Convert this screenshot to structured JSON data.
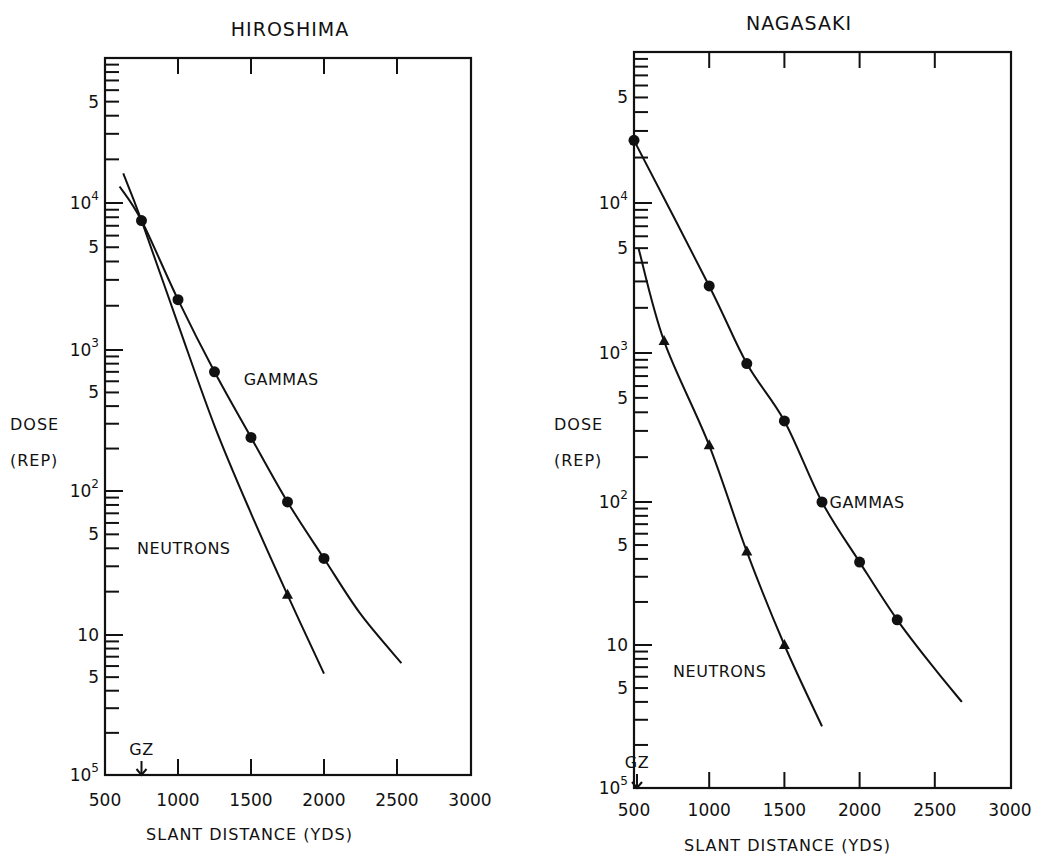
{
  "figure": {
    "charts_count": 2
  },
  "chart_data": [
    {
      "id": "hiroshima",
      "type": "line",
      "title": "HIROSHIMA",
      "xlabel": "SLANT DISTANCE (YDS)",
      "ylabel": [
        "DOSE",
        "(REP)"
      ],
      "yscale": "log",
      "xlim": [
        500,
        3000
      ],
      "ylim": [
        1,
        100000
      ],
      "x_ticks": [
        500,
        1000,
        1500,
        2000,
        2500,
        3000
      ],
      "x_tick_labels": [
        "500",
        "1000",
        "1500",
        "2000",
        "2500",
        "3000"
      ],
      "y_major_tick_labels": [
        {
          "value": 100000,
          "base": "10",
          "exp": "5"
        },
        {
          "value": 50000,
          "base": "5",
          "exp": ""
        },
        {
          "value": 10000,
          "base": "10",
          "exp": "4"
        },
        {
          "value": 5000,
          "base": "5",
          "exp": ""
        },
        {
          "value": 1000,
          "base": "10",
          "exp": "3"
        },
        {
          "value": 500,
          "base": "5",
          "exp": ""
        },
        {
          "value": 100,
          "base": "10",
          "exp": "2"
        },
        {
          "value": 50,
          "base": "5",
          "exp": ""
        },
        {
          "value": 10,
          "base": "10",
          "exp": ""
        },
        {
          "value": 5,
          "base": "5",
          "exp": ""
        }
      ],
      "grid": false,
      "annotations": [
        {
          "text": "GZ",
          "x": 750,
          "marker": "down-arrow"
        }
      ],
      "series": [
        {
          "name": "GAMMAS",
          "marker": "circle",
          "points": [
            {
              "x": 750,
              "y": 7600
            },
            {
              "x": 1000,
              "y": 2200
            },
            {
              "x": 1250,
              "y": 700
            },
            {
              "x": 1500,
              "y": 240
            },
            {
              "x": 1750,
              "y": 84
            },
            {
              "x": 2000,
              "y": 34
            }
          ],
          "curve": [
            [
              600,
              13000
            ],
            [
              750,
              7600
            ],
            [
              1000,
              2200
            ],
            [
              1250,
              700
            ],
            [
              1500,
              240
            ],
            [
              1750,
              84
            ],
            [
              2000,
              34
            ],
            [
              2250,
              14
            ],
            [
              2530,
              6.3
            ]
          ],
          "label_pos": {
            "x": 1450,
            "y": 620
          }
        },
        {
          "name": "NEUTRONS",
          "marker": "triangle",
          "points": [
            {
              "x": 1750,
              "y": 19
            }
          ],
          "curve": [
            [
              625,
              16000
            ],
            [
              750,
              7600
            ],
            [
              1000,
              1500
            ],
            [
              1250,
              290
            ],
            [
              1500,
              70
            ],
            [
              1750,
              19
            ],
            [
              2000,
              5.3
            ]
          ],
          "label_pos": {
            "x": 720,
            "y": 40
          }
        }
      ],
      "layout": {
        "plot_left": 105,
        "plot_right": 471,
        "plot_top": 58,
        "plot_bottom": 775,
        "x_px": [
          [
            500,
            105
          ],
          [
            3000,
            470
          ]
        ],
        "decade_px": {
          "100000": 58,
          "10000": 203,
          "1000": 350,
          "100": 491,
          "10": 635,
          "1": 775
        },
        "title_x": 290,
        "title_y": 36,
        "ylabel_x": 10,
        "ylabel_y1": 430,
        "ylabel_y2": 466,
        "xlabel_x": 146,
        "xlabel_y": 840,
        "xtick_label_y": 806
      }
    },
    {
      "id": "nagasaki",
      "type": "line",
      "title": "NAGASAKI",
      "xlabel": "SLANT DISTANCE (YDS)",
      "ylabel": [
        "DOSE",
        "(REP)"
      ],
      "yscale": "log",
      "xlim": [
        500,
        3000
      ],
      "ylim": [
        1,
        100000
      ],
      "x_ticks": [
        500,
        1000,
        1500,
        2000,
        2500,
        3000
      ],
      "x_tick_labels": [
        "500",
        "1000",
        "1500",
        "2000",
        "2500",
        "3000"
      ],
      "y_major_tick_labels": [
        {
          "value": 100000,
          "base": "10",
          "exp": "5"
        },
        {
          "value": 50000,
          "base": "5",
          "exp": ""
        },
        {
          "value": 10000,
          "base": "10",
          "exp": "4"
        },
        {
          "value": 5000,
          "base": "5",
          "exp": ""
        },
        {
          "value": 1000,
          "base": "10",
          "exp": "3"
        },
        {
          "value": 500,
          "base": "5",
          "exp": ""
        },
        {
          "value": 100,
          "base": "10",
          "exp": "2"
        },
        {
          "value": 50,
          "base": "5",
          "exp": ""
        },
        {
          "value": 10,
          "base": "10",
          "exp": ""
        },
        {
          "value": 5,
          "base": "5",
          "exp": ""
        }
      ],
      "grid": false,
      "annotations": [
        {
          "text": "GZ",
          "x": 520,
          "marker": "down-arrow"
        }
      ],
      "series": [
        {
          "name": "GAMMAS",
          "marker": "circle",
          "points": [
            {
              "x": 500,
              "y": 26000
            },
            {
              "x": 1000,
              "y": 2800
            },
            {
              "x": 1250,
              "y": 850
            },
            {
              "x": 1500,
              "y": 350
            },
            {
              "x": 1750,
              "y": 100
            },
            {
              "x": 2000,
              "y": 38
            },
            {
              "x": 2250,
              "y": 15
            }
          ],
          "curve": [
            [
              500,
              26000
            ],
            [
              1000,
              2800
            ],
            [
              1250,
              850
            ],
            [
              1500,
              350
            ],
            [
              1750,
              100
            ],
            [
              2000,
              38
            ],
            [
              2250,
              15
            ],
            [
              2500,
              6.8
            ],
            [
              2680,
              4
            ]
          ],
          "label_pos": {
            "x": 1800,
            "y": 100
          }
        },
        {
          "name": "NEUTRONS",
          "marker": "triangle",
          "points": [
            {
              "x": 700,
              "y": 1200
            },
            {
              "x": 1000,
              "y": 240
            },
            {
              "x": 1250,
              "y": 45
            },
            {
              "x": 1500,
              "y": 10
            }
          ],
          "curve": [
            [
              530,
              5000
            ],
            [
              700,
              1200
            ],
            [
              1000,
              240
            ],
            [
              1250,
              45
            ],
            [
              1500,
              10
            ],
            [
              1750,
              2.7
            ]
          ],
          "label_pos": {
            "x": 760,
            "y": 6.6
          }
        }
      ],
      "layout": {
        "plot_left": 105,
        "plot_right": 482,
        "plot_top": 52,
        "plot_bottom": 788,
        "x_px": [
          [
            500,
            105
          ],
          [
            3000,
            481
          ]
        ],
        "decade_px": {
          "100000": 52,
          "10000": 203,
          "1000": 353,
          "100": 502,
          "10": 645,
          "1": 788
        },
        "title_x": 270,
        "title_y": 30,
        "ylabel_x": 25,
        "ylabel_y1": 430,
        "ylabel_y2": 466,
        "xlabel_x": 155,
        "xlabel_y": 851,
        "xtick_label_y": 816
      }
    }
  ]
}
